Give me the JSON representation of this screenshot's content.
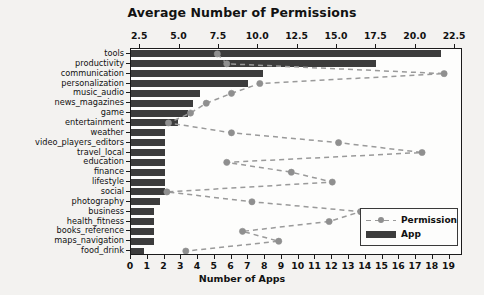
{
  "chart_data": {
    "type": "bar",
    "title": "",
    "top_axis_label": "Average Number of Permissions",
    "bottom_axis_label": "Number of Apps",
    "ylabel": "",
    "orientation": "horizontal",
    "grid": false,
    "legend_position": "lower right",
    "categories": [
      "tools",
      "productivity",
      "communication",
      "personalization",
      "music_audio",
      "news_magazines",
      "game",
      "entertainment",
      "weather",
      "video_players_editors",
      "travel_local",
      "education",
      "finance",
      "lifestyle",
      "social",
      "photography",
      "business",
      "health_fitness",
      "books_reference",
      "maps_navigation",
      "food_drink"
    ],
    "series": [
      {
        "name": "App",
        "axis": "bottom",
        "axis_label": "Number of Apps",
        "xlim": [
          0,
          19.8
        ],
        "ticks": [
          0,
          1,
          2,
          3,
          4,
          5,
          6,
          7,
          8,
          9,
          10,
          11,
          12,
          13,
          14,
          15,
          16,
          17,
          18,
          19
        ],
        "tick_labels": [
          "0",
          "1",
          "2",
          "3",
          "4",
          "5",
          "6",
          "7",
          "8",
          "9",
          "10",
          "11",
          "12",
          "13",
          "14",
          "15",
          "16",
          "17",
          "18",
          "19"
        ],
        "values": [
          18.5,
          14.6,
          7.9,
          7.0,
          4.1,
          3.7,
          3.4,
          2.8,
          2.0,
          2.0,
          2.0,
          2.0,
          2.0,
          2.0,
          2.0,
          1.7,
          1.4,
          1.4,
          1.4,
          1.4,
          0.8
        ],
        "color": "#3c3c3c"
      },
      {
        "name": "Permission",
        "axis": "top",
        "axis_label": "Average Number of Permissions",
        "xlim": [
          1.92,
          23.0
        ],
        "ticks": [
          2.5,
          5.0,
          7.5,
          10.0,
          12.5,
          15.0,
          17.5,
          20.0,
          22.5
        ],
        "tick_labels": [
          "2.5",
          "5.0",
          "7.5",
          "10.0",
          "12.5",
          "15.0",
          "17.5",
          "20.0",
          "22.5"
        ],
        "values": [
          7.4,
          8.0,
          21.8,
          10.1,
          8.3,
          6.7,
          5.7,
          4.3,
          8.3,
          15.1,
          20.4,
          8.0,
          12.1,
          14.7,
          4.2,
          9.6,
          16.5,
          14.5,
          9.0,
          11.3,
          5.4
        ],
        "color": "#9a9a9a",
        "linestyle": "dashed",
        "marker": "circle"
      }
    ]
  },
  "legend": {
    "permission_label": "Permission",
    "app_label": "App"
  },
  "colors": {
    "bar": "#3c3c3c",
    "line": "#9a9a9a",
    "marker": "#8f8f8f",
    "frame": "#1b1b1b",
    "background": "#f3f2f0",
    "plot_background": "#fdfdfc"
  }
}
